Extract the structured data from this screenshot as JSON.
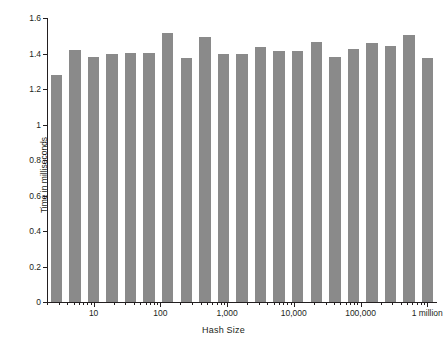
{
  "chart_data": {
    "type": "bar",
    "title": "",
    "xlabel": "Hash Size",
    "ylabel": "Time in milliseconds",
    "xscale": "log",
    "xlim": [
      2,
      1400000
    ],
    "ylim": [
      0,
      1.6
    ],
    "grid": false,
    "legend": null,
    "bar_color": "#8a8a8a",
    "axis_color": "#231f20",
    "y_ticks": [
      0,
      0.2,
      0.4,
      0.6,
      0.8,
      1,
      1.2,
      1.4,
      1.6
    ],
    "y_tick_labels": [
      "0",
      "0.2",
      "0.4",
      "0.6",
      "0.8",
      "1",
      "1.2",
      "1.4",
      "1.6"
    ],
    "x_major_ticks": [
      10,
      100,
      1000,
      10000,
      100000,
      1000000
    ],
    "x_tick_labels": [
      "10",
      "100",
      "1,000",
      "10,000",
      "100,000",
      "1 million"
    ],
    "categories": [
      2,
      3,
      4,
      6,
      8,
      12,
      17,
      24,
      35,
      50,
      71,
      101,
      144,
      205,
      292,
      416,
      593,
      845,
      1204,
      1715,
      1000000
    ],
    "values": [
      1.28,
      1.42,
      1.38,
      1.395,
      1.405,
      1.405,
      1.515,
      1.375,
      1.495,
      1.4,
      1.395,
      1.435,
      1.415,
      1.415,
      1.465,
      1.38,
      1.425,
      1.46,
      1.445,
      1.505,
      1.375
    ]
  }
}
